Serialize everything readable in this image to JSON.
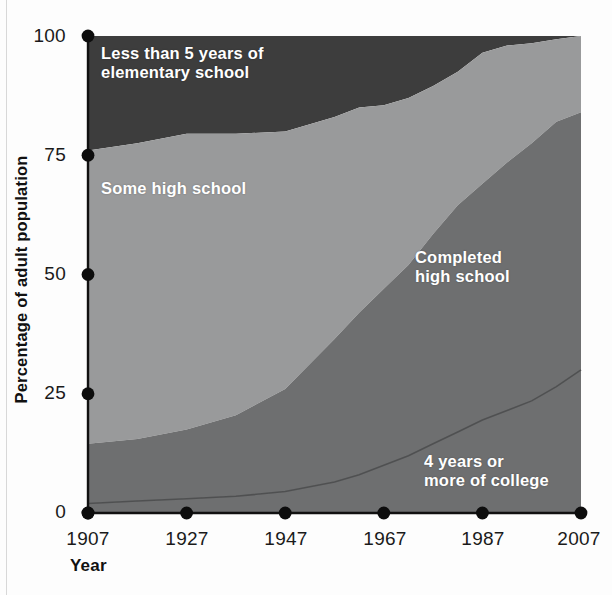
{
  "chart_data": {
    "type": "area",
    "title": "",
    "subtitle": "",
    "xlabel": "Year",
    "ylabel": "Percentage of adult population",
    "xlim": [
      1907,
      2007
    ],
    "ylim": [
      0,
      100
    ],
    "grid": false,
    "stacked": true,
    "stack_mode": "100%",
    "legend_position": "inline-labels",
    "x_tick_labels": [
      "1907",
      "1927",
      "1947",
      "1967",
      "1987",
      "2007"
    ],
    "x_ticks": [
      1907,
      1927,
      1947,
      1967,
      1987,
      2007
    ],
    "y_tick_labels": [
      "0",
      "25",
      "50",
      "75",
      "100"
    ],
    "y_ticks": [
      0,
      25,
      50,
      75,
      100
    ],
    "x": [
      1907,
      1917,
      1927,
      1937,
      1947,
      1957,
      1962,
      1967,
      1972,
      1977,
      1982,
      1987,
      1992,
      1997,
      2002,
      2007
    ],
    "series": [
      {
        "name": "4 years or more of college",
        "color": "#6e6f70",
        "stack_order": 1,
        "values": [
          2.0,
          2.5,
          3.0,
          3.5,
          4.5,
          6.5,
          8.0,
          10.0,
          12.0,
          14.5,
          17.0,
          19.5,
          21.5,
          23.5,
          26.5,
          30.0
        ]
      },
      {
        "name": "Completed high school",
        "color": "#6e6f70",
        "stack_order": 2,
        "values": [
          12.5,
          13.0,
          14.5,
          17.0,
          21.5,
          30.0,
          34.0,
          37.0,
          40.0,
          44.0,
          47.5,
          49.5,
          52.0,
          54.0,
          55.5,
          54.0
        ]
      },
      {
        "name": "Some high school",
        "color": "#999a9b",
        "stack_order": 3,
        "values": [
          61.5,
          62.0,
          62.0,
          59.0,
          54.0,
          46.5,
          43.0,
          38.5,
          35.0,
          31.0,
          28.0,
          27.5,
          24.5,
          21.0,
          17.5,
          16.0
        ]
      },
      {
        "name": "Less than 5 years of elementary school",
        "color": "#3d3d3d",
        "stack_order": 4,
        "values": [
          24.0,
          22.5,
          20.5,
          20.5,
          20.0,
          17.0,
          15.0,
          14.5,
          13.0,
          10.5,
          7.5,
          3.5,
          2.0,
          1.5,
          0.7,
          0.0
        ]
      }
    ],
    "cumulative_top_boundaries": {
      "college": [
        2.0,
        2.5,
        3.0,
        3.5,
        4.5,
        6.5,
        8.0,
        10.0,
        12.0,
        14.5,
        17.0,
        19.5,
        21.5,
        23.5,
        26.5,
        30.0
      ],
      "completed_high_school": [
        14.5,
        15.5,
        17.5,
        20.5,
        26.0,
        36.5,
        42.0,
        47.0,
        52.0,
        58.5,
        64.5,
        69.0,
        73.5,
        77.5,
        82.0,
        84.0
      ],
      "some_high_school": [
        76.0,
        77.5,
        79.5,
        79.5,
        80.0,
        83.0,
        85.0,
        85.5,
        87.0,
        89.5,
        92.5,
        96.5,
        98.0,
        98.5,
        99.3,
        100.0
      ],
      "elementary": [
        100,
        100,
        100,
        100,
        100,
        100,
        100,
        100,
        100,
        100,
        100,
        100,
        100,
        100,
        100,
        100
      ]
    },
    "annotations": [
      {
        "id": "elementary",
        "text": "Less than 5 years of\nelementary school"
      },
      {
        "id": "some-high-school",
        "text": "Some high school"
      },
      {
        "id": "completed-high-school",
        "text": "Completed\nhigh school"
      },
      {
        "id": "college",
        "text": "4 years or\nmore of college"
      }
    ]
  },
  "axis": {
    "y_title": "Percentage of adult population",
    "x_title": "Year",
    "y_ticks": [
      "100",
      "75",
      "50",
      "25",
      "0"
    ],
    "x_ticks": [
      "1907",
      "1927",
      "1947",
      "1967",
      "1987",
      "2007"
    ]
  },
  "labels": {
    "elementary": "Less than 5 years of\nelementary school",
    "some_high_school": "Some high school",
    "completed_high_school": "Completed\nhigh school",
    "college": "4 years or\nmore of college"
  },
  "colors": {
    "elementary": "#3d3d3d",
    "some_high_school": "#999a9b",
    "completed_high_school": "#6e6f70",
    "college": "#6e6f70",
    "axis": "#111111",
    "background": "#fdfdfd"
  }
}
